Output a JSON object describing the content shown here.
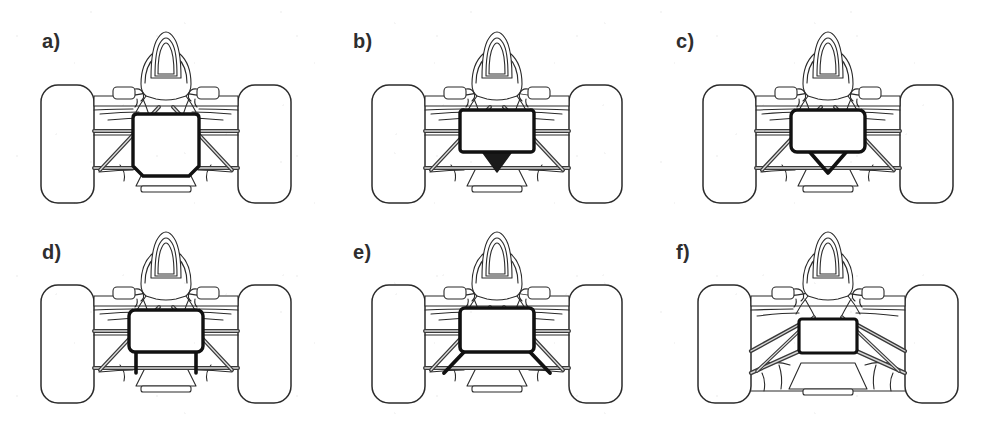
{
  "figure": {
    "view": "front elevation",
    "background_color": "#ffffff",
    "line_color": "#2b2b2b",
    "bold_line_color": "#111111",
    "fill_color": "#ffffff",
    "keel_fill_color": "#1a1a1a",
    "rows": 2,
    "columns": 3
  },
  "panels": [
    {
      "id": "a",
      "label": "a)",
      "keel_type": "no-keel-deep-chassis",
      "keel_description": "Deep square chassis box with no keel; lower wishbones attach directly to the bottom of the monocoque",
      "box_shape": "square",
      "box_width": 66,
      "box_height": 62,
      "has_keel": false,
      "keel_filled": false,
      "arms": "horizontal upper and lower wishbones with diagonal pushrods",
      "row": 1,
      "column": 1
    },
    {
      "id": "b",
      "label": "b)",
      "keel_type": "single-keel-filled",
      "keel_description": "Shallow wide chassis box with a solid single keel spike projecting down to the lower wishbone pickup",
      "box_shape": "wide-rectangle",
      "box_width": 74,
      "box_height": 42,
      "has_keel": true,
      "keel_filled": true,
      "keel_form": "solid-triangle",
      "arms": "horizontal upper and lower wishbones with diagonal pushrods",
      "row": 1,
      "column": 2
    },
    {
      "id": "c",
      "label": "c)",
      "keel_type": "v-keel-open",
      "keel_description": "Shallow chassis box with an open V keel; two converging members meet at a single low pickup point",
      "box_shape": "wide-rectangle",
      "box_width": 74,
      "box_height": 42,
      "has_keel": true,
      "keel_filled": false,
      "keel_form": "open-v",
      "arms": "horizontal upper and lower wishbones with diagonal pushrods",
      "row": 1,
      "column": 3
    },
    {
      "id": "d",
      "label": "d)",
      "keel_type": "twin-keel-vertical",
      "keel_description": "Chassis box with twin vertical keel blades dropping straight down to separate lower wishbone pickups",
      "box_shape": "wide-rectangle",
      "box_width": 74,
      "box_height": 42,
      "has_keel": true,
      "keel_filled": false,
      "keel_form": "twin-vertical-legs",
      "arms": "horizontal upper and lower wishbones with diagonal pushrods",
      "row": 2,
      "column": 1
    },
    {
      "id": "e",
      "label": "e)",
      "keel_type": "twin-keel-splayed",
      "keel_description": "Chassis box with twin splayed keel blades angled outward to widely spaced lower wishbone pickups",
      "box_shape": "wide-rectangle",
      "box_width": 74,
      "box_height": 44,
      "has_keel": true,
      "keel_filled": false,
      "keel_form": "twin-splayed-legs",
      "arms": "horizontal upper and lower wishbones with diagonal pushrods",
      "row": 2,
      "column": 2
    },
    {
      "id": "f",
      "label": "f)",
      "keel_type": "zero-keel",
      "keel_description": "Zero keel: narrow raised chassis box with both upper and lower wishbones angled steeply upward from low outboard pickups to the chassis sides",
      "box_shape": "narrow-rectangle",
      "box_width": 58,
      "box_height": 34,
      "has_keel": false,
      "keel_filled": false,
      "arms": "steeply inclined converging upper and lower wishbones with pushrods",
      "row": 2,
      "column": 3
    }
  ],
  "car_parts": [
    {
      "name": "front-wheel-left",
      "shape": "rounded-rectangle",
      "fill": "#ffffff"
    },
    {
      "name": "front-wheel-right",
      "shape": "rounded-rectangle",
      "fill": "#ffffff"
    },
    {
      "name": "roll-hoop",
      "shape": "arch"
    },
    {
      "name": "cockpit-surround",
      "shape": "rounded-trapezoid"
    },
    {
      "name": "engine-cover",
      "shape": "tapered-body"
    },
    {
      "name": "mirror-left",
      "shape": "small-rounded-rect"
    },
    {
      "name": "mirror-right",
      "shape": "small-rounded-rect"
    },
    {
      "name": "upper-wishbone",
      "shape": "horizontal-bar"
    },
    {
      "name": "lower-wishbone",
      "shape": "horizontal-bar"
    },
    {
      "name": "pushrod",
      "shape": "diagonal-bar"
    },
    {
      "name": "nose-cone",
      "shape": "tapered-trapezoid"
    },
    {
      "name": "front-wing",
      "shape": "horizontal-plate"
    },
    {
      "name": "chassis-box",
      "shape": "bold-outlined-box"
    }
  ]
}
